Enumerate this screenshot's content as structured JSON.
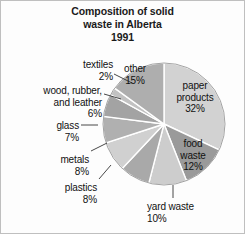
{
  "title": {
    "line1": "Composition of solid",
    "line2": "waste in Alberta",
    "line3": "1991"
  },
  "chart_data": {
    "type": "pie",
    "title": "Composition of solid waste in Alberta 1991",
    "xlabel": "",
    "ylabel": "",
    "unit": "percent",
    "legend": "none (direct slice labels)",
    "grid": false,
    "start_angle_deg": -90,
    "direction": "clockwise",
    "categories": [
      "paper products",
      "food waste",
      "yard waste",
      "plastics",
      "metals",
      "glass",
      "wood, rubber, and leather",
      "textiles",
      "other"
    ],
    "values": [
      32,
      12,
      10,
      8,
      8,
      7,
      6,
      2,
      15
    ],
    "labels": [
      "paper products 32%",
      "food waste 12%",
      "yard waste 10%",
      "plastics 8%",
      "metals 8%",
      "glass 7%",
      "wood, rubber, and leather 6%",
      "textiles 2%",
      "other 15%"
    ],
    "colors": [
      "#d2d2d2",
      "#9a9a9a",
      "#cdcdcd",
      "#a9a9a9",
      "#d0d0d0",
      "#b0b0b0",
      "#a3a3a3",
      "#c2c2c2",
      "#aeaeae"
    ],
    "slice_label_placement": [
      "inside",
      "inside",
      "outside",
      "outside",
      "outside",
      "outside",
      "outside",
      "outside",
      "inside"
    ],
    "total": 100
  },
  "slices": {
    "paper": {
      "name": "paper products",
      "l1": "paper",
      "l2": "products",
      "pct": "32%"
    },
    "food": {
      "name": "food waste",
      "l1": "food",
      "l2": "waste",
      "pct": "12%"
    },
    "yard": {
      "name": "yard waste",
      "l1": "yard waste",
      "pct": "10%"
    },
    "plastics": {
      "name": "plastics",
      "l1": "plastics",
      "pct": "8%"
    },
    "metals": {
      "name": "metals",
      "l1": "metals",
      "pct": "8%"
    },
    "glass": {
      "name": "glass",
      "l1": "glass",
      "pct": "7%"
    },
    "wood": {
      "name": "wood, rubber, and leather",
      "l1": "wood, rubber,",
      "l2": "and leather",
      "pct": "6%"
    },
    "textiles": {
      "name": "textiles",
      "l1": "textiles",
      "pct": "2%"
    },
    "other": {
      "name": "other",
      "l1": "other",
      "pct": "15%"
    }
  }
}
